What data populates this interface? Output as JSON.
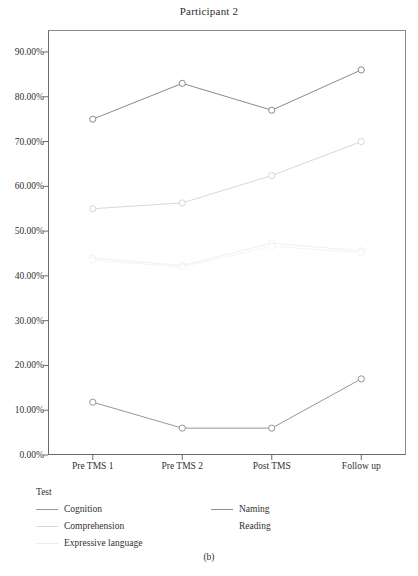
{
  "figure": {
    "title": "Participant 2",
    "caption": "(b)"
  },
  "legend": {
    "title": "Test",
    "items": [
      {
        "label": "Cognition",
        "color": "#9a9a9a",
        "show_swatch": true,
        "col": 0,
        "row": 0
      },
      {
        "label": "Naming",
        "color": "#8f8f8f",
        "show_swatch": true,
        "col": 1,
        "row": 0
      },
      {
        "label": "Comprehension",
        "color": "#d8d8d8",
        "show_swatch": true,
        "col": 0,
        "row": 1
      },
      {
        "label": "Reading",
        "color": "#ffffff",
        "show_swatch": false,
        "col": 1,
        "row": 1
      },
      {
        "label": "Expressive language",
        "color": "#ececec",
        "show_swatch": true,
        "col": 0,
        "row": 2
      }
    ]
  },
  "axes": {
    "y_ticks": [
      "0.00%",
      "10.00%",
      "20.00%",
      "30.00%",
      "40.00%",
      "50.00%",
      "60.00%",
      "70.00%",
      "80.00%",
      "90.00%"
    ],
    "x_ticks": [
      "Pre TMS 1",
      "Pre TMS 2",
      "Post TMS",
      "Follow up"
    ]
  },
  "chart_data": {
    "type": "line",
    "title": "Participant 2",
    "xlabel": "",
    "ylabel": "",
    "categories": [
      "Pre TMS 1",
      "Pre TMS 2",
      "Post TMS",
      "Follow up"
    ],
    "ylim": [
      0,
      90
    ],
    "ytick_values": [
      0,
      10,
      20,
      30,
      40,
      50,
      60,
      70,
      80,
      90
    ],
    "ytick_labels": [
      "0.00%",
      "10.00%",
      "20.00%",
      "30.00%",
      "40.00%",
      "50.00%",
      "60.00%",
      "70.00%",
      "80.00%",
      "90.00%"
    ],
    "grid": false,
    "legend_position": "below-left",
    "legend_title": "Test",
    "marker": "open-circle",
    "series": [
      {
        "name": "Naming",
        "values": [
          75.0,
          83.0,
          77.0,
          86.0
        ],
        "color": "#7d7d7d"
      },
      {
        "name": "Reading",
        "values": [
          55.0,
          56.3,
          62.4,
          70.0
        ],
        "color": "#d2d2d2"
      },
      {
        "name": "Comprehension",
        "values": [
          44.0,
          42.3,
          47.3,
          45.6
        ],
        "color": "#ededed"
      },
      {
        "name": "Expressive language",
        "values": [
          43.5,
          42.0,
          46.6,
          45.2
        ],
        "color": "#f3f3f3"
      },
      {
        "name": "Cognition",
        "values": [
          11.8,
          6.0,
          6.0,
          17.0
        ],
        "color": "#8a8a8a"
      }
    ]
  }
}
